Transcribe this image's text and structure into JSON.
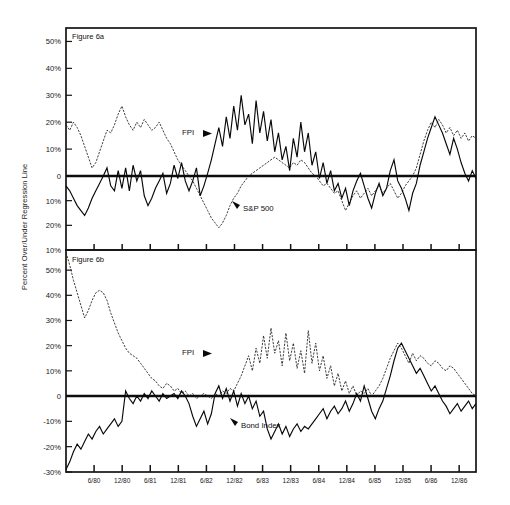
{
  "figure": {
    "y_axis_title": "Percent Over/Under Regression Line",
    "panel_a_label": "Figure 6a",
    "panel_b_label": "Figure 6b"
  },
  "chart_data": [
    {
      "type": "line",
      "title": "Figure 6a",
      "xlabel": "",
      "ylabel": "Percent Over/Under Regression Line",
      "ylim": [
        -30,
        55
      ],
      "yticks": [
        50,
        40,
        30,
        20,
        10,
        0,
        -10,
        -20,
        -30
      ],
      "ytick_labels": [
        "50%",
        "40%",
        "30%",
        "20%",
        "10%",
        "0",
        "10%",
        "20%",
        "10%"
      ],
      "grid": false,
      "legend_position": "inline-annotation",
      "x": [
        "6/80",
        "12/80",
        "6/81",
        "12/81",
        "6/82",
        "12/82",
        "6/83",
        "12/83",
        "6/84",
        "12/84",
        "6/85",
        "12/85",
        "6/86",
        "12/86"
      ],
      "xlim": [
        "1/80",
        "12/86"
      ],
      "series": [
        {
          "name": "FPI",
          "style": "solid",
          "annotation": "FPI",
          "values": [
            -4,
            -6,
            -9,
            -12,
            -14,
            -16,
            -13,
            -9,
            -6,
            -3,
            0,
            3,
            -4,
            -6,
            2,
            -5,
            3,
            -6,
            4,
            -2,
            2,
            -8,
            -12,
            -9,
            -5,
            -2,
            1,
            -7,
            -3,
            4,
            -1,
            5,
            -2,
            -6,
            -2,
            3,
            -8,
            -4,
            1,
            6,
            12,
            18,
            11,
            22,
            14,
            26,
            17,
            30,
            19,
            23,
            12,
            28,
            16,
            24,
            13,
            21,
            9,
            16,
            6,
            11,
            2,
            14,
            7,
            20,
            9,
            16,
            4,
            9,
            -1,
            5,
            -3,
            2,
            -6,
            -3,
            -9,
            -5,
            -12,
            -6,
            -2,
            1,
            -4,
            -9,
            -13,
            -7,
            -3,
            -8,
            -5,
            2,
            6,
            -2,
            -5,
            -9,
            -14,
            -7,
            -3,
            4,
            9,
            14,
            18,
            22,
            19,
            16,
            12,
            8,
            14,
            10,
            5,
            1,
            -2,
            2,
            -1
          ]
        },
        {
          "name": "S&P 500",
          "style": "dotted",
          "annotation": "S&P 500",
          "values": [
            19,
            17,
            20,
            18,
            15,
            11,
            7,
            3,
            5,
            9,
            13,
            17,
            16,
            19,
            23,
            26,
            22,
            19,
            17,
            20,
            18,
            21,
            19,
            17,
            18,
            20,
            17,
            14,
            12,
            9,
            6,
            4,
            2,
            0,
            -2,
            -5,
            -8,
            -11,
            -14,
            -17,
            -19,
            -21,
            -19,
            -16,
            -12,
            -9,
            -7,
            -4,
            -2,
            0,
            1,
            2,
            3,
            4,
            5,
            6,
            7,
            6,
            5,
            4,
            3,
            5,
            4,
            6,
            5,
            3,
            1,
            0,
            -2,
            -4,
            -3,
            -5,
            -7,
            -6,
            -10,
            -14,
            -11,
            -8,
            -6,
            -9,
            -7,
            -5,
            -8,
            -6,
            -4,
            -7,
            -5,
            -3,
            -6,
            -9,
            -7,
            -4,
            -2,
            0,
            3,
            8,
            13,
            17,
            20,
            18,
            21,
            19,
            16,
            18,
            15,
            17,
            14,
            16,
            13,
            15,
            14
          ]
        }
      ]
    },
    {
      "type": "line",
      "title": "Figure 6b",
      "xlabel": "",
      "ylabel": "Percent Over/Under Regression Line",
      "ylim": [
        -30,
        58
      ],
      "yticks": [
        50,
        40,
        30,
        20,
        10,
        0,
        -10,
        -20,
        -30
      ],
      "ytick_labels": [
        "50%",
        "40%",
        "30%",
        "20%",
        "10%",
        "0",
        "-10%",
        "-20%",
        "-30%"
      ],
      "grid": false,
      "legend_position": "inline-annotation",
      "x": [
        "6/80",
        "12/80",
        "6/81",
        "12/81",
        "6/82",
        "12/82",
        "6/83",
        "12/83",
        "6/84",
        "12/84",
        "6/85",
        "12/85",
        "6/86",
        "12/86"
      ],
      "xlim": [
        "1/80",
        "12/86"
      ],
      "series": [
        {
          "name": "FPI",
          "style": "dotted",
          "annotation": "FPI",
          "values": [
            57,
            52,
            46,
            41,
            36,
            31,
            34,
            38,
            41,
            42,
            41,
            38,
            33,
            29,
            25,
            22,
            19,
            17,
            16,
            15,
            13,
            11,
            9,
            7,
            6,
            4,
            3,
            5,
            4,
            2,
            3,
            1,
            2,
            0,
            1,
            -1,
            0,
            1,
            0,
            -1,
            1,
            0,
            2,
            1,
            3,
            2,
            5,
            8,
            12,
            16,
            10,
            19,
            13,
            24,
            15,
            27,
            17,
            22,
            12,
            25,
            14,
            21,
            11,
            18,
            9,
            26,
            13,
            21,
            10,
            16,
            7,
            12,
            4,
            9,
            2,
            6,
            1,
            4,
            0,
            2,
            1,
            3,
            0,
            2,
            4,
            7,
            11,
            15,
            18,
            21,
            19,
            16,
            13,
            17,
            14,
            16,
            15,
            13,
            12,
            14,
            13,
            11,
            10,
            12,
            11,
            9,
            7,
            5,
            3,
            1,
            0
          ]
        },
        {
          "name": "Bond Index",
          "style": "solid",
          "annotation": "Bond Index",
          "values": [
            -29,
            -26,
            -22,
            -19,
            -21,
            -18,
            -15,
            -17,
            -14,
            -12,
            -15,
            -13,
            -11,
            -9,
            -12,
            -10,
            2,
            -1,
            -3,
            0,
            -2,
            1,
            -1,
            2,
            0,
            -2,
            1,
            -1,
            0,
            1,
            -1,
            2,
            0,
            -3,
            -8,
            -12,
            -9,
            -6,
            -11,
            -7,
            1,
            4,
            -1,
            3,
            -2,
            2,
            -4,
            1,
            -3,
            0,
            -5,
            -2,
            -8,
            -6,
            -13,
            -17,
            -14,
            -11,
            -15,
            -12,
            -16,
            -13,
            -11,
            -14,
            -12,
            -13,
            -11,
            -9,
            -7,
            -5,
            -9,
            -6,
            -4,
            -7,
            -5,
            -2,
            -6,
            -3,
            1,
            -2,
            4,
            -1,
            -6,
            -9,
            -5,
            -2,
            3,
            8,
            14,
            19,
            21,
            18,
            15,
            12,
            9,
            11,
            8,
            5,
            2,
            4,
            1,
            -2,
            -4,
            -7,
            -5,
            -3,
            -6,
            -4,
            -2,
            -5,
            -3
          ]
        }
      ]
    }
  ]
}
